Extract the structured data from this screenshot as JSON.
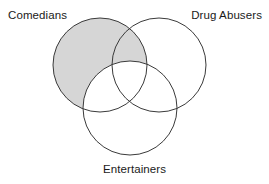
{
  "diagram": {
    "type": "venn-3-set",
    "title": "",
    "sets": [
      {
        "id": "comedians",
        "label": "Comedians",
        "center_x": 100,
        "center_y": 65,
        "radius": 47,
        "label_position": "top-left"
      },
      {
        "id": "drug_abusers",
        "label": "Drug Abusers",
        "center_x": 159,
        "center_y": 65,
        "radius": 47,
        "label_position": "top-right"
      },
      {
        "id": "entertainers",
        "label": "Entertainers",
        "center_x": 130,
        "center_y": 108,
        "radius": 47,
        "label_position": "bottom-center"
      }
    ],
    "shaded_region": {
      "description": "Comedians minus Entertainers",
      "fill_color": "#d6d6d6",
      "includes": [
        "comedians-only",
        "comedians-and-drug-abusers-only"
      ],
      "excludes": [
        "entertainers"
      ]
    },
    "colors": {
      "stroke": "#3a3a3a",
      "shade": "#d6d6d6",
      "background": "#ffffff",
      "text": "#1a1a1a"
    },
    "stroke_width": 1
  }
}
